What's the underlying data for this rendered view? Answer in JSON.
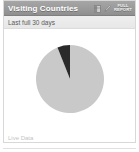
{
  "widget": {
    "title": "Visiting Countries",
    "subtitle": "Last full 30 days",
    "footnote": "Live Data",
    "actions": {
      "grid_icon": "grid-icon",
      "edit_icon": "pencil-icon",
      "full_report_line1": "FULL",
      "full_report_line2": "REPORT"
    }
  },
  "colors": {
    "titlebar": "#9a9a9a",
    "subbar": "#e7e7e7",
    "slice_major": "#c9c9c9",
    "slice_minor": "#2a2a2a",
    "border": "#d8d8d8",
    "footnote": "#c4c4c4"
  },
  "chart_data": {
    "type": "pie",
    "title": "Visiting Countries",
    "subtitle": "Last full 30 days",
    "categories": [
      "Other countries",
      "Top country"
    ],
    "values": [
      94,
      6
    ],
    "unit": "percent",
    "colors": [
      "#c9c9c9",
      "#2a2a2a"
    ],
    "start_angle_deg": 0,
    "legend": "none",
    "grid": false,
    "labels_shown": false
  }
}
